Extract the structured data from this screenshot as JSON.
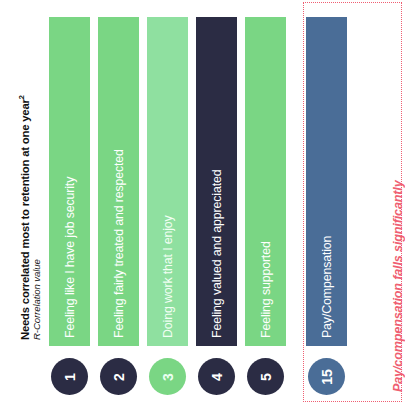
{
  "axis": {
    "title": "Needs correlated most to retention at one year",
    "title_superscript": "2",
    "subtitle": "R-Correlation value"
  },
  "annotation": {
    "text": "Pay/compensation falls significantly",
    "color": "#ef5f72"
  },
  "colors": {
    "green": "#7ad684",
    "mint": "#8fe0a0",
    "navy": "#2b2c44",
    "slate": "#4a6d97",
    "red": "#ef5f72",
    "background": "#ffffff"
  },
  "chart_data": {
    "type": "bar",
    "title": "Needs correlated most to retention at one year",
    "ylabel": "R-Correlation value",
    "xlabel": "",
    "grid": false,
    "legend": false,
    "orientation": "vertical-equal-height-ranked",
    "categories": [
      "Feeling like I have job security",
      "Feeling fairly treated and respected",
      "Doing work that I enjoy",
      "Feeling valued and appreciated",
      "Feeling supported",
      "Pay/Compensation"
    ],
    "ranks": [
      1,
      2,
      3,
      4,
      5,
      15
    ],
    "values": [
      1,
      2,
      3,
      4,
      5,
      15
    ],
    "annotations": [
      "Pay/compensation falls significantly"
    ]
  },
  "bars": [
    {
      "label": "Feeling like I have job security",
      "rank": "1",
      "fill": "#7ad684",
      "circle_fill": "#2b2c44",
      "label_tone": "normal"
    },
    {
      "label": "Feeling fairly treated and respected",
      "rank": "2",
      "fill": "#7ad684",
      "circle_fill": "#2b2c44",
      "label_tone": "normal"
    },
    {
      "label": "Doing work that I enjoy",
      "rank": "3",
      "fill": "#8fe0a0",
      "circle_fill": "#7ad684",
      "label_tone": "light"
    },
    {
      "label": "Feeling valued and appreciated",
      "rank": "4",
      "fill": "#2b2c44",
      "circle_fill": "#2b2c44",
      "label_tone": "normal"
    },
    {
      "label": "Feeling supported",
      "rank": "5",
      "fill": "#7ad684",
      "circle_fill": "#2b2c44",
      "label_tone": "normal"
    },
    {
      "label": "Pay/Compensation",
      "rank": "15",
      "fill": "#4a6d97",
      "circle_fill": "#4a6d97",
      "label_tone": "normal"
    }
  ]
}
